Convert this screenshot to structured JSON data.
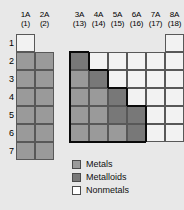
{
  "diagram": {
    "colors": {
      "metal": "#9a9a9a",
      "metalloid": "#787878",
      "nonmetal": "#f2f2f2",
      "grid_line": "#585858",
      "stair_line": "#0a0a0a",
      "background": "#e8e8e8"
    }
  },
  "columns": [
    {
      "group": "1A",
      "iupac": "(1)",
      "block": "left",
      "x": 16
    },
    {
      "group": "2A",
      "iupac": "(2)",
      "block": "left",
      "x": 35
    },
    {
      "group": "3A",
      "iupac": "(13)",
      "block": "right",
      "x": 70
    },
    {
      "group": "4A",
      "iupac": "(14)",
      "block": "right",
      "x": 89
    },
    {
      "group": "5A",
      "iupac": "(15)",
      "block": "right",
      "x": 108
    },
    {
      "group": "6A",
      "iupac": "(16)",
      "block": "right",
      "x": 127
    },
    {
      "group": "7A",
      "iupac": "(17)",
      "block": "right",
      "x": 146
    },
    {
      "group": "8A",
      "iupac": "(18)",
      "block": "right",
      "x": 165
    }
  ],
  "rows": [
    {
      "label": "1",
      "y": 34
    },
    {
      "label": "2",
      "y": 52
    },
    {
      "label": "3",
      "y": 70
    },
    {
      "label": "4",
      "y": 88
    },
    {
      "label": "5",
      "y": 106
    },
    {
      "label": "6",
      "y": 124
    },
    {
      "label": "7",
      "y": 142
    }
  ],
  "cells": [
    {
      "row": 1,
      "col": "1A",
      "type": "nonmetal"
    },
    {
      "row": 1,
      "col": "2A",
      "type": "empty"
    },
    {
      "row": 2,
      "col": "1A",
      "type": "metal"
    },
    {
      "row": 2,
      "col": "2A",
      "type": "metal"
    },
    {
      "row": 3,
      "col": "1A",
      "type": "metal"
    },
    {
      "row": 3,
      "col": "2A",
      "type": "metal"
    },
    {
      "row": 4,
      "col": "1A",
      "type": "metal"
    },
    {
      "row": 4,
      "col": "2A",
      "type": "metal"
    },
    {
      "row": 5,
      "col": "1A",
      "type": "metal"
    },
    {
      "row": 5,
      "col": "2A",
      "type": "metal"
    },
    {
      "row": 6,
      "col": "1A",
      "type": "metal"
    },
    {
      "row": 6,
      "col": "2A",
      "type": "metal"
    },
    {
      "row": 7,
      "col": "1A",
      "type": "metal"
    },
    {
      "row": 7,
      "col": "2A",
      "type": "metal"
    },
    {
      "row": 1,
      "col": "3A",
      "type": "empty"
    },
    {
      "row": 1,
      "col": "4A",
      "type": "empty"
    },
    {
      "row": 1,
      "col": "5A",
      "type": "empty"
    },
    {
      "row": 1,
      "col": "6A",
      "type": "empty"
    },
    {
      "row": 1,
      "col": "7A",
      "type": "empty"
    },
    {
      "row": 1,
      "col": "8A",
      "type": "nonmetal"
    },
    {
      "row": 2,
      "col": "3A",
      "type": "metalloid"
    },
    {
      "row": 2,
      "col": "4A",
      "type": "nonmetal"
    },
    {
      "row": 2,
      "col": "5A",
      "type": "nonmetal"
    },
    {
      "row": 2,
      "col": "6A",
      "type": "nonmetal"
    },
    {
      "row": 2,
      "col": "7A",
      "type": "nonmetal"
    },
    {
      "row": 2,
      "col": "8A",
      "type": "nonmetal"
    },
    {
      "row": 3,
      "col": "3A",
      "type": "metal"
    },
    {
      "row": 3,
      "col": "4A",
      "type": "metalloid"
    },
    {
      "row": 3,
      "col": "5A",
      "type": "nonmetal"
    },
    {
      "row": 3,
      "col": "6A",
      "type": "nonmetal"
    },
    {
      "row": 3,
      "col": "7A",
      "type": "nonmetal"
    },
    {
      "row": 3,
      "col": "8A",
      "type": "nonmetal"
    },
    {
      "row": 4,
      "col": "3A",
      "type": "metal"
    },
    {
      "row": 4,
      "col": "4A",
      "type": "metal"
    },
    {
      "row": 4,
      "col": "5A",
      "type": "metalloid"
    },
    {
      "row": 4,
      "col": "6A",
      "type": "nonmetal"
    },
    {
      "row": 4,
      "col": "7A",
      "type": "nonmetal"
    },
    {
      "row": 4,
      "col": "8A",
      "type": "nonmetal"
    },
    {
      "row": 5,
      "col": "3A",
      "type": "metal"
    },
    {
      "row": 5,
      "col": "4A",
      "type": "metal"
    },
    {
      "row": 5,
      "col": "5A",
      "type": "metalloid"
    },
    {
      "row": 5,
      "col": "6A",
      "type": "metalloid"
    },
    {
      "row": 5,
      "col": "7A",
      "type": "nonmetal"
    },
    {
      "row": 5,
      "col": "8A",
      "type": "nonmetal"
    },
    {
      "row": 6,
      "col": "3A",
      "type": "metal"
    },
    {
      "row": 6,
      "col": "4A",
      "type": "metal"
    },
    {
      "row": 6,
      "col": "5A",
      "type": "metal"
    },
    {
      "row": 6,
      "col": "6A",
      "type": "metalloid"
    },
    {
      "row": 6,
      "col": "7A",
      "type": "nonmetal"
    },
    {
      "row": 6,
      "col": "8A",
      "type": "nonmetal"
    }
  ],
  "legend": {
    "items": [
      {
        "label": "Metals",
        "swatch": "metal"
      },
      {
        "label": "Metalloids",
        "swatch": "metalloid"
      },
      {
        "label": "Nonmetals",
        "swatch": "nonmetal"
      }
    ]
  }
}
